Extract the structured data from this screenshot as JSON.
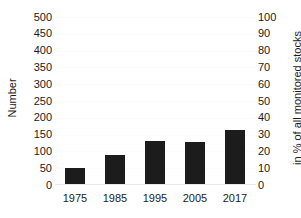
{
  "chart_data": {
    "type": "bar",
    "title": "",
    "subtitle": "",
    "categories": [
      "1975",
      "1985",
      "1995",
      "2005",
      "2017"
    ],
    "values": [
      50,
      88,
      130,
      127,
      165
    ],
    "series": [
      {
        "name": "Number",
        "values": [
          50,
          88,
          130,
          127,
          165
        ]
      }
    ],
    "xlabel": "",
    "ylabel": "Number",
    "y2label": "in % of all monitored stocks",
    "ylim": [
      0,
      500
    ],
    "y2lim": [
      0,
      100
    ],
    "ytick_labels": [
      "500",
      "450",
      "400",
      "350",
      "300",
      "250",
      "200",
      "150",
      "100",
      "50",
      "0"
    ],
    "ytick_values": [
      500,
      450,
      400,
      350,
      300,
      250,
      200,
      150,
      100,
      50,
      0
    ],
    "y2tick_labels": [
      "100",
      "90",
      "80",
      "70",
      "60",
      "50",
      "40",
      "30",
      "20",
      "10",
      "0"
    ],
    "y2tick_values": [
      100,
      90,
      80,
      70,
      60,
      50,
      40,
      30,
      20,
      10,
      0
    ],
    "xtick_labels": [
      "1975",
      "1985",
      "1995",
      "2005",
      "2017"
    ],
    "grid": true,
    "grid_color": "#fbfbfb",
    "legend": false,
    "legend_position": "none",
    "bar_color": "#1c1c1c",
    "background_color": "#ffffff",
    "text_color": "#1a1a1a",
    "annotations": []
  }
}
